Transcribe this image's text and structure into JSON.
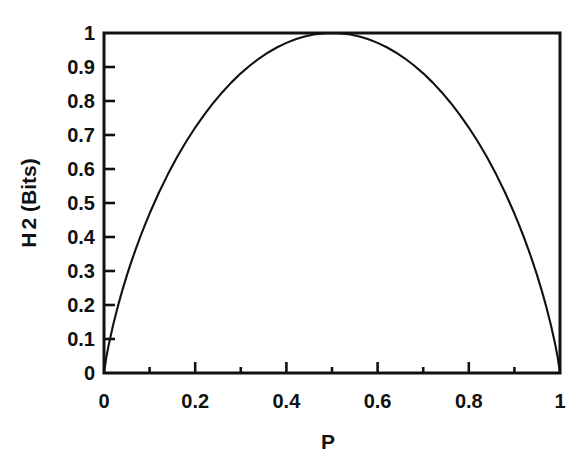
{
  "chart_data": {
    "type": "line",
    "title": "",
    "xlabel": "P",
    "ylabel": "H 2 (Bits)",
    "ylabel_parts": {
      "symbol": "H",
      "subscript": "2",
      "units": "(Bits)"
    },
    "xlim": [
      0,
      1
    ],
    "ylim": [
      0,
      1
    ],
    "grid": false,
    "legend": null,
    "x_tick_labels": [
      "0",
      "0.2",
      "0.4",
      "0.6",
      "0.8",
      "1"
    ],
    "x_tick_values": [
      0,
      0.2,
      0.4,
      0.6,
      0.8,
      1
    ],
    "x_minor_tick_values": [
      0.1,
      0.3,
      0.5,
      0.7,
      0.9
    ],
    "y_tick_labels": [
      "0",
      "0.1",
      "0.2",
      "0.3",
      "0.4",
      "0.5",
      "0.6",
      "0.7",
      "0.8",
      "0.9",
      "1"
    ],
    "y_tick_values": [
      0,
      0.1,
      0.2,
      0.3,
      0.4,
      0.5,
      0.6,
      0.7,
      0.8,
      0.9,
      1
    ],
    "series": [
      {
        "name": "binary entropy",
        "color": "#111111",
        "x": [
          0,
          0.005,
          0.01,
          0.02,
          0.03,
          0.04,
          0.05,
          0.06,
          0.07,
          0.08,
          0.09,
          0.1,
          0.12,
          0.14,
          0.16,
          0.18,
          0.2,
          0.22,
          0.24,
          0.26,
          0.28,
          0.3,
          0.32,
          0.34,
          0.36,
          0.38,
          0.4,
          0.42,
          0.44,
          0.46,
          0.48,
          0.5,
          0.52,
          0.54,
          0.56,
          0.58,
          0.6,
          0.62,
          0.64,
          0.66,
          0.68,
          0.7,
          0.72,
          0.74,
          0.76,
          0.78,
          0.8,
          0.82,
          0.84,
          0.86,
          0.88,
          0.9,
          0.91,
          0.92,
          0.93,
          0.94,
          0.95,
          0.96,
          0.97,
          0.98,
          0.99,
          0.995,
          1
        ],
        "y": [
          0,
          0.0454,
          0.0808,
          0.1414,
          0.1944,
          0.2423,
          0.2864,
          0.3274,
          0.3659,
          0.4022,
          0.4365,
          0.469,
          0.5294,
          0.5842,
          0.6343,
          0.6801,
          0.7219,
          0.7602,
          0.795,
          0.8267,
          0.8555,
          0.8813,
          0.9044,
          0.9249,
          0.9427,
          0.958,
          0.971,
          0.9815,
          0.9896,
          0.9954,
          0.9988,
          1.0,
          0.9988,
          0.9954,
          0.9896,
          0.9815,
          0.971,
          0.958,
          0.9427,
          0.9249,
          0.9044,
          0.8813,
          0.8555,
          0.8267,
          0.795,
          0.7602,
          0.7219,
          0.6801,
          0.6343,
          0.5842,
          0.5294,
          0.469,
          0.4365,
          0.4022,
          0.3659,
          0.3274,
          0.2864,
          0.2423,
          0.1944,
          0.1414,
          0.0808,
          0.0454,
          0
        ]
      }
    ]
  },
  "figure": {
    "background_color": "#ffffff",
    "axis_color": "#111111"
  }
}
